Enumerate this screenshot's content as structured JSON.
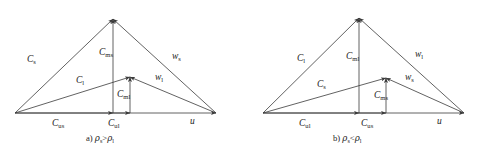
{
  "figure": {
    "type": "vector-velocity-triangle-diagram",
    "panel_count": 2,
    "line_color": "#3a3a3a",
    "text_color": "#222222",
    "background": "#ffffff"
  },
  "panels": [
    {
      "id": "a",
      "caption_prefix": "a)",
      "caption_rho_left": "ρ",
      "caption_rho_left_sub": "s",
      "caption_relation": ">",
      "caption_rho_right": "ρ",
      "caption_rho_right_sub": "l",
      "caption_plain": "a) ρs>ρl",
      "outer_triangle": {
        "left_leg": {
          "base": "C",
          "sub": "s"
        },
        "vertical": {
          "base": "C",
          "sub": "ms"
        },
        "right_leg": {
          "base": "w",
          "sub": "s"
        }
      },
      "inner_triangle": {
        "left_leg": {
          "base": "C",
          "sub": "l"
        },
        "vertical": {
          "base": "C",
          "sub": "ml"
        },
        "right_leg": {
          "base": "w",
          "sub": "l"
        }
      },
      "baseline": [
        {
          "base": "C",
          "sub": "us"
        },
        {
          "base": "C",
          "sub": "ul"
        },
        {
          "base": "u",
          "sub": ""
        }
      ]
    },
    {
      "id": "b",
      "caption_prefix": "b)",
      "caption_rho_left": "ρ",
      "caption_rho_left_sub": "s",
      "caption_relation": "<",
      "caption_rho_right": "ρ",
      "caption_rho_right_sub": "l",
      "caption_plain": "b) ρs<ρl",
      "outer_triangle": {
        "left_leg": {
          "base": "C",
          "sub": "l"
        },
        "vertical": {
          "base": "C",
          "sub": "ml"
        },
        "right_leg": {
          "base": "w",
          "sub": "l"
        }
      },
      "inner_triangle": {
        "left_leg": {
          "base": "C",
          "sub": "s"
        },
        "vertical": {
          "base": "C",
          "sub": "ms"
        },
        "right_leg": {
          "base": "w",
          "sub": "s"
        }
      },
      "baseline": [
        {
          "base": "C",
          "sub": "ul"
        },
        {
          "base": "C",
          "sub": "us"
        },
        {
          "base": "u",
          "sub": ""
        }
      ]
    }
  ]
}
